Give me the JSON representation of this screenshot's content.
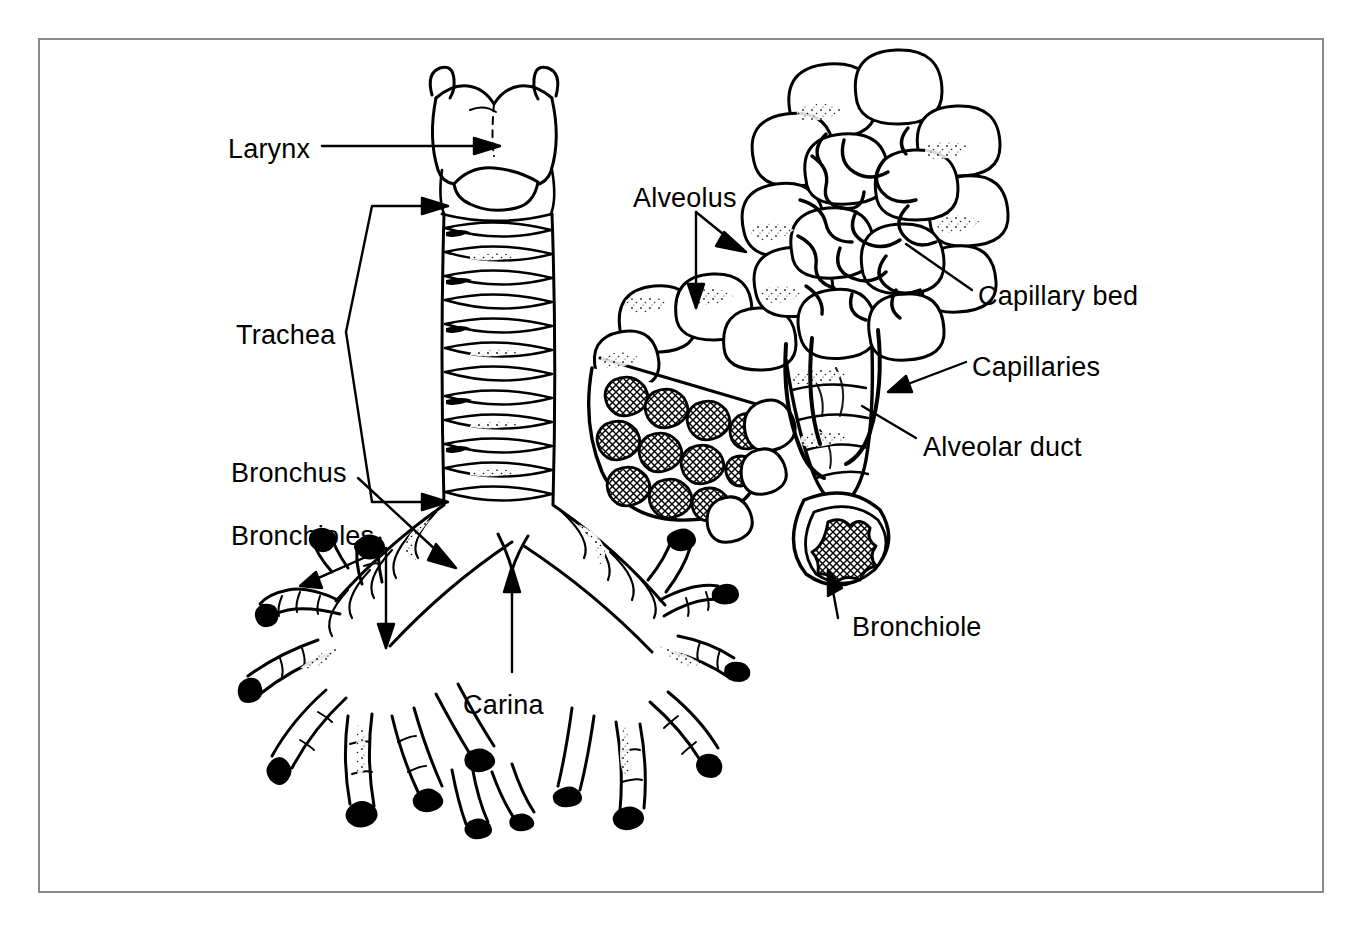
{
  "figure": {
    "style": "black-and-white line drawing",
    "background_color": "#ffffff",
    "ink_color": "#000000",
    "frame_color": "#8a8a8a"
  },
  "labels": [
    {
      "id": "larynx",
      "text": "Larynx",
      "x": 228,
      "y": 136,
      "leader": "horizontal-arrow-right",
      "points_to": "larynx / thyroid cartilage"
    },
    {
      "id": "trachea",
      "text": "Trachea",
      "x": 236,
      "y": 322,
      "leader": "bracket-two-arrows",
      "points_to": "trachea upper and lower segments"
    },
    {
      "id": "bronchus",
      "text": "Bronchus",
      "x": 231,
      "y": 460,
      "leader": "diagonal-arrow-down-right",
      "points_to": "left main bronchus"
    },
    {
      "id": "bronchioles",
      "text": "Bronchioles",
      "x": 231,
      "y": 523,
      "leader": "two-prong-arrow",
      "points_to": "small bronchioles of left lung"
    },
    {
      "id": "carina",
      "text": "Carina",
      "x": 463,
      "y": 692,
      "leader": "vertical-arrow-up",
      "points_to": "tracheal bifurcation ridge"
    },
    {
      "id": "alveolus",
      "text": "Alveolus",
      "x": 633,
      "y": 185,
      "leader": "two-arrows-diagonal-and-down",
      "points_to": "alveolar sacs"
    },
    {
      "id": "capillary-bed",
      "text": "Capillary bed",
      "x": 978,
      "y": 283,
      "leader": "diagonal-line-left-up",
      "points_to": "capillary network over alveolar sac"
    },
    {
      "id": "capillaries",
      "text": "Capillaries",
      "x": 972,
      "y": 354,
      "leader": "arrow-left",
      "points_to": "capillary vessels on alveolar duct"
    },
    {
      "id": "alveolar-duct",
      "text": "Alveolar duct",
      "x": 923,
      "y": 434,
      "leader": "diagonal-line-left-up",
      "points_to": "alveolar duct"
    },
    {
      "id": "bronchiole-right",
      "text": "Bronchiole",
      "x": 852,
      "y": 614,
      "leader": "short-arrow-up",
      "points_to": "cut end of terminal bronchiole"
    }
  ]
}
